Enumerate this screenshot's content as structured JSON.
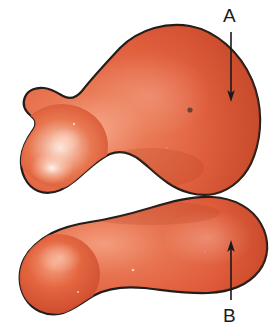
{
  "figure": {
    "type": "labeled-anatomical-illustration",
    "background_color": "#ffffff",
    "width": 277,
    "height": 331,
    "specimen": {
      "name": "two-lobed-organic-specimen",
      "fill_color": "#e2613f",
      "fill_color_mid": "#dd5636",
      "fill_color_dark": "#c2452a",
      "highlight_color": "#fbe4da",
      "outline_color": "#231d1a",
      "outline_width": 2.2,
      "lobes": [
        {
          "name": "upper-lobe",
          "label_key": "A",
          "description": "large upper mass with leftward tapering horn"
        },
        {
          "name": "lower-lobe",
          "label_key": "B",
          "description": "lower elongated mass with rounded left bulb"
        }
      ],
      "speck": {
        "name": "surface-speck",
        "color": "#5b3a2e",
        "x": 190,
        "y": 110,
        "r": 2.6
      }
    },
    "labels": [
      {
        "id": "A",
        "text": "A",
        "color": "#1a1a1a",
        "text_x": 223,
        "text_y": 6,
        "arrow": {
          "name": "arrow-a",
          "direction": "down",
          "x": 231,
          "y_start": 32,
          "y_end": 101,
          "color": "#1a1a1a",
          "stroke_width": 1.6
        }
      },
      {
        "id": "B",
        "text": "B",
        "color": "#1a1a1a",
        "text_x": 223,
        "text_y": 306,
        "arrow": {
          "name": "arrow-b",
          "direction": "up",
          "x": 231,
          "y_start": 300,
          "y_end": 241,
          "color": "#1a1a1a",
          "stroke_width": 1.6
        }
      }
    ]
  }
}
